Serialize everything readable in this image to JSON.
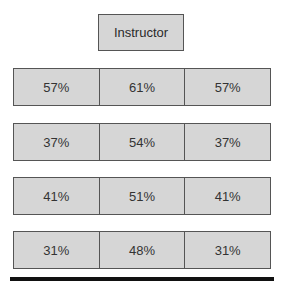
{
  "header": {
    "title": "Instructor"
  },
  "rows": [
    {
      "cells": [
        "57%",
        "61%",
        "57%"
      ]
    },
    {
      "cells": [
        "37%",
        "54%",
        "37%"
      ]
    },
    {
      "cells": [
        "41%",
        "51%",
        "41%"
      ]
    },
    {
      "cells": [
        "31%",
        "48%",
        "31%"
      ]
    }
  ],
  "colors": {
    "box_fill": "#d6d6d6",
    "border": "#555555",
    "baseline": "#111111"
  }
}
